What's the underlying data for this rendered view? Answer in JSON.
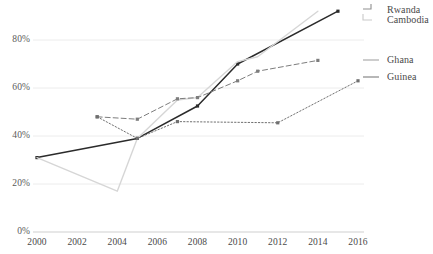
{
  "chart_data": {
    "type": "line",
    "title": "",
    "xlabel": "",
    "ylabel": "",
    "xlim": [
      2000,
      2016
    ],
    "ylim": [
      0,
      100
    ],
    "grid": true,
    "legend_position": "right",
    "x_ticks": [
      "2000",
      "2002",
      "2004",
      "2006",
      "2008",
      "2010",
      "2012",
      "2014",
      "2016"
    ],
    "y_ticks": [
      "0%",
      "20%",
      "40%",
      "60%",
      "80%"
    ],
    "y_tick_values": [
      0,
      20,
      40,
      60,
      80
    ],
    "series": [
      {
        "name": "Rwanda",
        "style": "solid",
        "color": "#2b2b2b",
        "markers": true,
        "x": [
          2000,
          2005,
          2008,
          2010,
          2015
        ],
        "values": [
          31,
          39,
          52.5,
          70,
          92
        ]
      },
      {
        "name": "Cambodia",
        "style": "solid",
        "color": "#d6d6d6",
        "markers": false,
        "x": [
          2000,
          2004,
          2005,
          2007,
          2008,
          2010,
          2011,
          2014
        ],
        "values": [
          31,
          17,
          39,
          55,
          56,
          71,
          73,
          92
        ]
      },
      {
        "name": "Ghana",
        "style": "dashed",
        "color": "#7d7d7d",
        "markers": true,
        "x": [
          2003,
          2005,
          2007,
          2008,
          2010,
          2011,
          2014
        ],
        "values": [
          48,
          47,
          55.5,
          56,
          63,
          67,
          71.5
        ]
      },
      {
        "name": "Guinea",
        "style": "dotted",
        "color": "#6f6f6f",
        "markers": true,
        "x": [
          2003,
          2005,
          2007,
          2012,
          2016
        ],
        "values": [
          48,
          39,
          46,
          45.5,
          63
        ]
      }
    ]
  },
  "legend": {
    "entries": [
      {
        "label": "Rwanda"
      },
      {
        "label": "Cambodia"
      },
      {
        "label": "Ghana"
      },
      {
        "label": "Guinea"
      }
    ]
  },
  "colors": {
    "grid": "#ececec",
    "axis": "#d9d9d9",
    "tick_text": "#5a5a5a"
  }
}
